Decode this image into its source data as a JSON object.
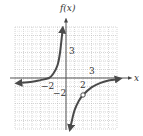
{
  "chart_data": {
    "type": "line",
    "title": "",
    "ylabel": "f(x)",
    "xlabel": "x",
    "xlim": [
      -6,
      6
    ],
    "ylim": [
      -6,
      6
    ],
    "grid": true,
    "tick_labels": {
      "x": [
        {
          "value": -2,
          "label": "−2"
        },
        {
          "value": 2,
          "label": "2"
        },
        {
          "value": 3,
          "label": "3"
        }
      ],
      "y": [
        {
          "value": 3,
          "label": "3"
        },
        {
          "value": -2,
          "label": "−2"
        }
      ]
    },
    "asymptotes": {
      "vertical": 0,
      "horizontal": 0
    },
    "series": [
      {
        "name": "left-branch",
        "points": [
          [
            -5.6,
            -0.6
          ],
          [
            -4,
            -0.45
          ],
          [
            -3,
            -0.25
          ],
          [
            -2,
            0
          ],
          [
            -1.5,
            0.5
          ],
          [
            -1,
            1.5
          ],
          [
            -0.7,
            3
          ],
          [
            -0.4,
            5.7
          ]
        ],
        "arrows": [
          "start",
          "end"
        ]
      },
      {
        "name": "right-branch",
        "points": [
          [
            0.5,
            -5.9
          ],
          [
            0.7,
            -5
          ],
          [
            1,
            -3.8
          ],
          [
            1.5,
            -2.7
          ],
          [
            2,
            -2
          ],
          [
            3,
            -1.1
          ],
          [
            4,
            -0.6
          ],
          [
            5,
            -0.3
          ],
          [
            6.2,
            -0.1
          ]
        ],
        "arrows": [
          "start",
          "end"
        ],
        "open_point": [
          2,
          -2
        ]
      }
    ],
    "colors": {
      "curve": "#4a4a4a",
      "axis": "#555555",
      "grid_major": "#bbbbbb",
      "grid_minor": "#dddddd"
    }
  },
  "labels": {
    "y_axis": "f(x)",
    "x_axis": "x",
    "x_tick_neg2": "−2",
    "x_tick_2": "2",
    "x_tick_3": "3",
    "y_tick_3": "3",
    "y_tick_neg2": "−2"
  }
}
